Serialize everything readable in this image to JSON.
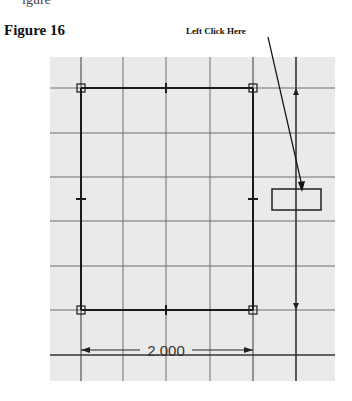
{
  "figure": {
    "title": "Figure 16",
    "partial_top_text": "igure",
    "callout_label": "Left Click Here"
  },
  "sketch": {
    "grid_color": "#6e6e6e",
    "background_color": "#eaeaea",
    "line_color": "#1a1a1a",
    "horizontal_dimension": "2.000"
  }
}
